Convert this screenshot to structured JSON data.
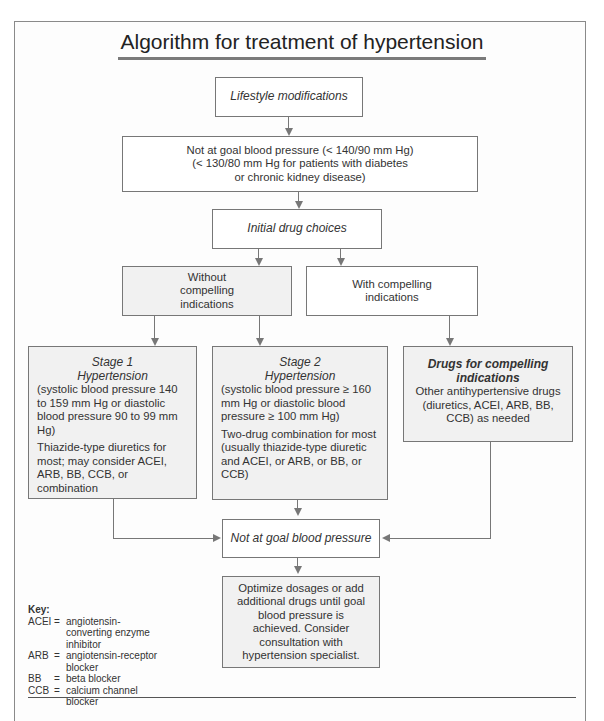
{
  "title": "Algorithm for treatment of hypertension",
  "nodes": {
    "lifestyle": {
      "label": "Lifestyle modifications"
    },
    "not_at_goal_1": {
      "lines": [
        "Not at goal blood pressure (< 140/90 mm Hg)",
        "(< 130/80 mm Hg for patients with diabetes",
        "or chronic kidney disease)"
      ]
    },
    "initial_drug_choices": {
      "label": "Initial drug choices"
    },
    "without_compelling": {
      "label": "Without compelling indications"
    },
    "with_compelling": {
      "label": "With compelling indications"
    },
    "stage1": {
      "heading_1": "Stage 1",
      "heading_2": "Hypertension",
      "criteria": "(systolic blood pressure 140 to 159 mm Hg or diastolic blood pressure 90 to 99 mm Hg)",
      "treatment": "Thiazide-type diuretics for most; may consider ACEI, ARB, BB, CCB, or combination"
    },
    "stage2": {
      "heading_1": "Stage 2",
      "heading_2": "Hypertension",
      "criteria": "(systolic blood pressure ≥ 160 mm Hg or diastolic blood pressure ≥ 100 mm Hg)",
      "treatment": "Two-drug combination for most (usually thiazide-type diuretic and ACEI, or ARB, or BB, or CCB)"
    },
    "compelling_drugs": {
      "heading": "Drugs for compelling indications",
      "body": "Other antihypertensive drugs (diuretics, ACEI, ARB, BB, CCB) as needed"
    },
    "not_at_goal_2": {
      "label": "Not at goal blood pressure"
    },
    "optimize": {
      "text": "Optimize dosages or add additional drugs until goal blood pressure is achieved. Consider consultation with hypertension specialist."
    }
  },
  "key": {
    "title": "Key:",
    "items": [
      {
        "abbr": "ACEI",
        "eq": "=",
        "meaning": "angiotensin-converting enzyme inhibitor"
      },
      {
        "abbr": "ARB",
        "eq": "=",
        "meaning": "angiotensin-receptor blocker"
      },
      {
        "abbr": "BB",
        "eq": "=",
        "meaning": "beta blocker"
      },
      {
        "abbr": "CCB",
        "eq": "=",
        "meaning": "calcium channel blocker"
      }
    ]
  },
  "colors": {
    "border": "#777777",
    "shaded_fill": "#f1f1f1",
    "text": "#333333"
  }
}
